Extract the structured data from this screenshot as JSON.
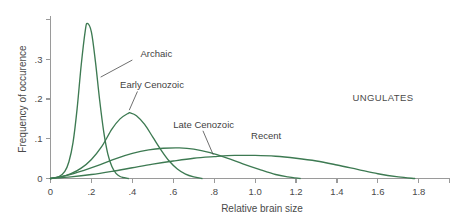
{
  "chart_data": {
    "type": "line",
    "title": "",
    "group_label": "UNGULATES",
    "xlabel": "Relative brain size",
    "ylabel": "Frequency of occurence",
    "xlim": [
      0,
      1.95
    ],
    "ylim": [
      0,
      0.41
    ],
    "grid": false,
    "legend_position": "inline-annotations",
    "accent_color": "#3d7a52",
    "axis_color": "#9a9a9a",
    "text_color": "#4a4a4a",
    "xticks": [
      0,
      0.2,
      0.4,
      0.6,
      0.8,
      1.0,
      1.2,
      1.4,
      1.6,
      1.8
    ],
    "xtick_labels": [
      "0",
      ".2",
      ".4",
      ".6",
      ".8",
      "1.0",
      "1.2",
      "1.4",
      "1.6",
      "1.8"
    ],
    "yticks": [
      0,
      0.1,
      0.2,
      0.3,
      0.4
    ],
    "ytick_labels": [
      "0",
      "1",
      "2",
      "3",
      ""
    ],
    "ytick_labels_display": [
      "0",
      ".1",
      ".2",
      ".3",
      ""
    ],
    "series": [
      {
        "name": "Archaic",
        "peak_x": 0.18,
        "peak_y": 0.39,
        "label_x": 0.44,
        "label_y": 0.305,
        "x": [
          0.0,
          0.04,
          0.07,
          0.09,
          0.11,
          0.13,
          0.15,
          0.17,
          0.18,
          0.2,
          0.22,
          0.24,
          0.26,
          0.28,
          0.3,
          0.32,
          0.34,
          0.36,
          0.38
        ],
        "values": [
          0.0,
          0.004,
          0.018,
          0.042,
          0.09,
          0.175,
          0.285,
          0.372,
          0.39,
          0.368,
          0.292,
          0.198,
          0.118,
          0.062,
          0.03,
          0.013,
          0.005,
          0.002,
          0.0
        ]
      },
      {
        "name": "Early Cenozoic",
        "peak_x": 0.39,
        "peak_y": 0.165,
        "label_x": 0.34,
        "label_y": 0.228,
        "x": [
          0.0,
          0.05,
          0.1,
          0.15,
          0.2,
          0.25,
          0.3,
          0.34,
          0.38,
          0.39,
          0.42,
          0.46,
          0.5,
          0.54,
          0.58,
          0.62,
          0.66,
          0.7,
          0.74
        ],
        "values": [
          0.0,
          0.004,
          0.012,
          0.026,
          0.048,
          0.08,
          0.124,
          0.15,
          0.164,
          0.165,
          0.158,
          0.136,
          0.104,
          0.072,
          0.044,
          0.024,
          0.011,
          0.004,
          0.0
        ]
      },
      {
        "name": "Late Cenozoic",
        "peak_x": 0.63,
        "peak_y": 0.077,
        "label_x": 0.6,
        "label_y": 0.128,
        "x": [
          0.0,
          0.08,
          0.16,
          0.24,
          0.32,
          0.4,
          0.48,
          0.55,
          0.63,
          0.7,
          0.78,
          0.86,
          0.94,
          1.02,
          1.1,
          1.16,
          1.22
        ],
        "values": [
          0.0,
          0.008,
          0.02,
          0.034,
          0.05,
          0.063,
          0.072,
          0.076,
          0.077,
          0.074,
          0.065,
          0.052,
          0.037,
          0.023,
          0.01,
          0.004,
          0.0
        ]
      },
      {
        "name": "Recent",
        "peak_x": 1.0,
        "peak_y": 0.058,
        "label_x": 0.98,
        "label_y": 0.1,
        "x": [
          0.0,
          0.1,
          0.2,
          0.3,
          0.4,
          0.5,
          0.6,
          0.7,
          0.8,
          0.9,
          1.0,
          1.1,
          1.2,
          1.3,
          1.4,
          1.5,
          1.6,
          1.7,
          1.78
        ],
        "values": [
          0.0,
          0.004,
          0.01,
          0.018,
          0.027,
          0.036,
          0.044,
          0.051,
          0.055,
          0.058,
          0.058,
          0.056,
          0.051,
          0.044,
          0.034,
          0.023,
          0.012,
          0.004,
          0.0
        ]
      }
    ]
  }
}
